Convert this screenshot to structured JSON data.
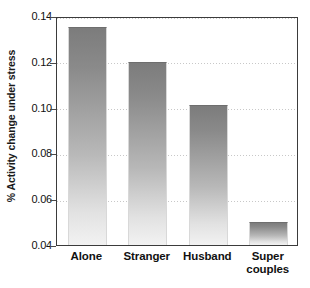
{
  "chart_data": {
    "type": "bar",
    "title": "",
    "xlabel": "",
    "ylabel": "% Activity change under stress",
    "categories": [
      "Alone",
      "Stranger",
      "Husband",
      "Super couples"
    ],
    "values": [
      0.135,
      0.12,
      0.101,
      0.05
    ],
    "ylim": [
      0.04,
      0.14
    ],
    "yticks": [
      0.04,
      0.06,
      0.08,
      0.1,
      0.12,
      0.14
    ],
    "ytick_labels": [
      "0.04",
      "0.06",
      "0.08",
      "0.10",
      "0.12",
      "0.14"
    ],
    "grid": true,
    "grid_style": "dotted",
    "legend": null,
    "bar_color": "#8a8a8a",
    "bar_gradient_top": "#7c7c7c",
    "bar_gradient_bottom": "#f2f2f2",
    "frame_color": "#3b3b3b",
    "grid_color": "#c8c8c8",
    "text_color": "#111111",
    "background": "#ffffff"
  }
}
